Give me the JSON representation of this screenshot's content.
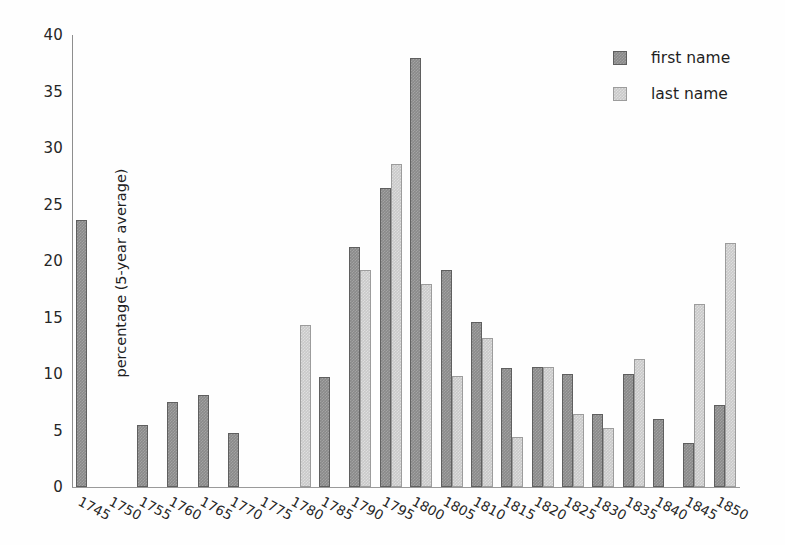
{
  "chart_data": {
    "type": "bar",
    "title": "",
    "xlabel": "",
    "ylabel": "percentage (5-year average)",
    "ylim": [
      0,
      40
    ],
    "yticks": [
      0,
      5,
      10,
      15,
      20,
      25,
      30,
      35,
      40
    ],
    "grid": false,
    "legend_position": "top-right",
    "categories": [
      "1745",
      "1750",
      "1755",
      "1760",
      "1765",
      "1770",
      "1775",
      "1780",
      "1785",
      "1790",
      "1795",
      "1800",
      "1805",
      "1810",
      "1815",
      "1820",
      "1825",
      "1830",
      "1835",
      "1840",
      "1845",
      "1850"
    ],
    "series": [
      {
        "name": "first name",
        "color": "#8a8a8a",
        "values": [
          23.6,
          0,
          5.5,
          7.5,
          8.1,
          4.8,
          0,
          0,
          9.7,
          21.2,
          26.5,
          38.0,
          19.2,
          14.6,
          10.5,
          10.6,
          10.0,
          6.5,
          10.0,
          6.0,
          3.9,
          7.3
        ]
      },
      {
        "name": "last name",
        "color": "#c9c9c9",
        "values": [
          0,
          0,
          0,
          0,
          0,
          0,
          0,
          14.3,
          0,
          19.2,
          28.6,
          18.0,
          9.8,
          13.2,
          4.4,
          10.6,
          6.5,
          5.2,
          11.3,
          0,
          16.2,
          21.6
        ]
      }
    ]
  },
  "legend": {
    "items": [
      {
        "label": "first name",
        "color": "#8a8a8a"
      },
      {
        "label": "last name",
        "color": "#c9c9c9"
      }
    ]
  }
}
